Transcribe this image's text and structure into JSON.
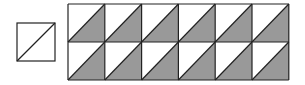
{
  "figure": {
    "colors": {
      "stroke": "#222222",
      "shaded": "#999999",
      "background": "#ffffff"
    },
    "unit_square": {
      "x": 17,
      "y": 23,
      "size": 38,
      "diagonal": "bottom-left to top-right",
      "shaded": false
    },
    "grid": {
      "x": 68,
      "y": 4,
      "cols": 6,
      "rows": 2,
      "cell_width": 36.8,
      "cell_height": 38,
      "diagonal": "bottom-left to top-right",
      "shaded_half": "lower-right"
    }
  }
}
